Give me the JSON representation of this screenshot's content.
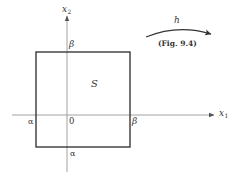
{
  "figure": {
    "region_label": "S",
    "axes": {
      "x_axis": {
        "name": "x",
        "subscript": "1"
      },
      "y_axis": {
        "name": "x",
        "subscript": "2"
      },
      "origin_label": "0"
    },
    "square_labels": {
      "top_on_y_axis": "β",
      "right_on_x_axis": "β",
      "left_on_x_axis": "α",
      "bottom_on_y_axis": "α"
    },
    "mapping": {
      "label": "h",
      "reference": "(Fig. 9.4)"
    }
  },
  "colors": {
    "axis": "#8a8a8a",
    "square_border": "#2a2a2a",
    "text": "#333333"
  }
}
